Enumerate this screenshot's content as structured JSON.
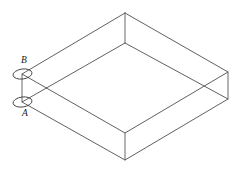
{
  "figure": {
    "kind": "isometric-slab-diagram",
    "background_color": "#ffffff",
    "line_color": "#4f4f4f",
    "marker_color": "#3d3d3d",
    "label_color": "#1a1a1a",
    "canvas": {
      "width": 242,
      "height": 177
    },
    "labels": [
      {
        "id": "B",
        "text": "B",
        "x": 21,
        "y": 56
      },
      {
        "id": "A",
        "text": "A",
        "x": 22,
        "y": 109
      }
    ],
    "markers": [
      {
        "id": "point-B",
        "cx": 22.5,
        "cy": 74,
        "rx": 9.5,
        "ry": 5,
        "rotation": -8
      },
      {
        "id": "point-A",
        "cx": 22.5,
        "cy": 102,
        "rx": 9.5,
        "ry": 5,
        "rotation": -8
      }
    ],
    "vertices": {
      "top_face": {
        "north": [
          125,
          13
        ],
        "east": [
          228,
          72
        ],
        "south": [
          125,
          133
        ],
        "west": [
          22,
          74
        ]
      },
      "bottom_face": {
        "north": [
          125,
          43
        ],
        "east": [
          228,
          99
        ],
        "south": [
          125,
          160
        ],
        "west": [
          22,
          102
        ]
      }
    },
    "edges": {
      "top_face_outline": "125,13 228,72 125,133 22,74 125,13",
      "bottom_face_outline": "125,43 228,99 125,160 22,102 125,43",
      "vertical_north": "125,13 125,43",
      "vertical_east": "228,72 228,99",
      "vertical_south": "125,133 125,160",
      "vertical_west": "22,74 22,102"
    },
    "visible_edges_note": "All twelve edges drawn as thin lines; the solid is transparent so back edges show through"
  }
}
